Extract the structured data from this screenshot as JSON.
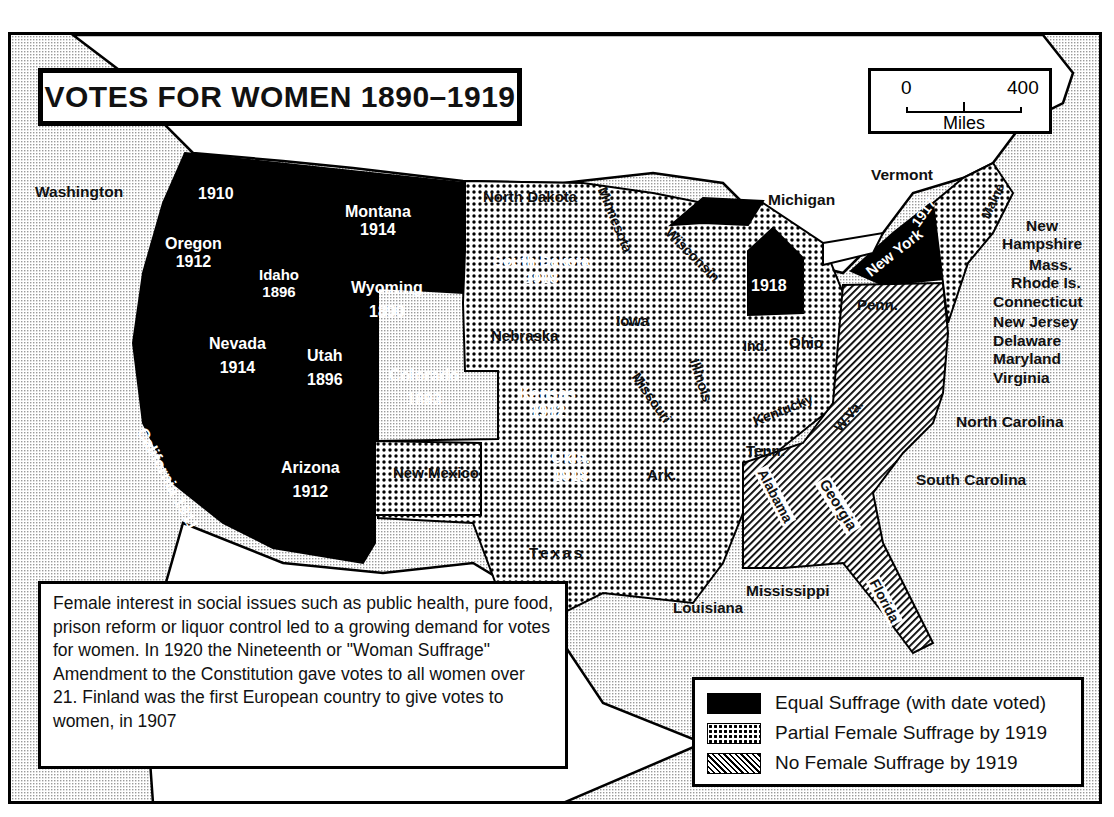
{
  "title": "VOTES FOR WOMEN 1890–1919",
  "scale": {
    "start": "0",
    "end": "400",
    "units": "Miles"
  },
  "note": "Female interest in social issues such as public health, pure food, prison reform or liquor control led to a growing demand for votes for women. In 1920 the Nineteenth or \"Woman Suffrage\" Amendment to the Constitution gave votes to all women over 21. Finland was the first European country to give votes to women, in 1907",
  "legend": {
    "items": [
      {
        "key": "equal",
        "label": "Equal Suffrage (with date voted)"
      },
      {
        "key": "partial",
        "label": "Partial Female Suffrage by 1919"
      },
      {
        "key": "none",
        "label": "No Female Suffrage by 1919"
      }
    ]
  },
  "colors": {
    "equal": "#000000",
    "partial": "dotted",
    "none": "hatched",
    "ocean": "#e6e6e6",
    "land_foreign": "#ffffff"
  },
  "states": {
    "washington": {
      "name": "Washington",
      "year": "1910",
      "status": "equal"
    },
    "oregon": {
      "name": "Oregon",
      "year": "1912",
      "status": "equal"
    },
    "california": {
      "name": "California",
      "year": "1911",
      "status": "equal"
    },
    "idaho": {
      "name": "Idaho",
      "year": "1896",
      "status": "equal"
    },
    "montana": {
      "name": "Montana",
      "year": "1914",
      "status": "equal"
    },
    "wyoming": {
      "name": "Wyoming",
      "year": "1890",
      "status": "equal"
    },
    "nevada": {
      "name": "Nevada",
      "year": "1914",
      "status": "equal"
    },
    "utah": {
      "name": "Utah",
      "year": "1896",
      "status": "equal"
    },
    "colorado": {
      "name": "Colorado",
      "year": "1893",
      "status": "equal"
    },
    "arizona": {
      "name": "Arizona",
      "year": "1912",
      "status": "equal"
    },
    "south_dakota": {
      "name": "South Dakota",
      "year": "1918",
      "status": "equal"
    },
    "kansas": {
      "name": "Kansas",
      "year": "1912",
      "status": "equal"
    },
    "oklahoma": {
      "name": "Okla.",
      "year": "1918",
      "status": "equal"
    },
    "michigan": {
      "name": "Michigan",
      "year": "1918",
      "status": "equal"
    },
    "new_york": {
      "name": "New York",
      "year": "1917",
      "status": "equal"
    },
    "north_dakota": {
      "name": "North Dakota",
      "status": "partial"
    },
    "nebraska": {
      "name": "Nebraska",
      "status": "partial"
    },
    "new_mexico": {
      "name": "New Mexico",
      "status": "partial"
    },
    "texas": {
      "name": "Texas",
      "status": "partial"
    },
    "minnesota": {
      "name": "Minnesota",
      "status": "partial"
    },
    "iowa": {
      "name": "Iowa",
      "status": "partial"
    },
    "missouri": {
      "name": "Missouri",
      "status": "partial"
    },
    "arkansas": {
      "name": "Ark.",
      "status": "partial"
    },
    "louisiana": {
      "name": "Louisiana",
      "status": "partial"
    },
    "wisconsin": {
      "name": "Wisconsin",
      "status": "partial"
    },
    "illinois": {
      "name": "Illinois",
      "status": "partial"
    },
    "indiana": {
      "name": "Ind.",
      "status": "partial"
    },
    "ohio": {
      "name": "Ohio",
      "status": "partial"
    },
    "kentucky": {
      "name": "Kentucky",
      "status": "partial"
    },
    "tennessee": {
      "name": "Tenn.",
      "status": "partial"
    },
    "mississippi": {
      "name": "Mississippi",
      "status": "partial"
    },
    "vermont": {
      "name": "Vermont",
      "status": "partial"
    },
    "maine": {
      "name": "Maine",
      "status": "partial"
    },
    "new_hampshire": {
      "name": "New Hampshire",
      "status": "partial"
    },
    "massachusetts": {
      "name": "Mass.",
      "status": "partial"
    },
    "rhode_island": {
      "name": "Rhode Is.",
      "status": "partial"
    },
    "connecticut": {
      "name": "Connecticut",
      "status": "none"
    },
    "new_jersey": {
      "name": "New Jersey",
      "status": "partial"
    },
    "delaware": {
      "name": "Delaware",
      "status": "none"
    },
    "maryland": {
      "name": "Maryland",
      "status": "none"
    },
    "pennsylvania": {
      "name": "Penn.",
      "status": "none"
    },
    "west_virginia": {
      "name": "W.Va.",
      "status": "none"
    },
    "virginia": {
      "name": "Virginia",
      "status": "none"
    },
    "north_carolina": {
      "name": "North Carolina",
      "status": "none"
    },
    "south_carolina": {
      "name": "South Carolina",
      "status": "none"
    },
    "georgia": {
      "name": "Georgia",
      "status": "none"
    },
    "alabama": {
      "name": "Alabama",
      "status": "none"
    },
    "florida": {
      "name": "Florida",
      "status": "none"
    }
  }
}
